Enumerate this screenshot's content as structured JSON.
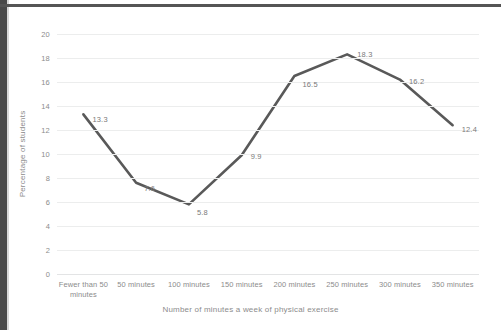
{
  "figure": {
    "frame_color": "#4a4a4a",
    "background": "#ffffff"
  },
  "chart_data": {
    "type": "line",
    "title": "",
    "categories": [
      "Fewer than 50 minutes",
      "50 minutes",
      "100 minutes",
      "150 minutes",
      "200 minutes",
      "250 minutes",
      "300 minutes",
      "350 minutes"
    ],
    "values": [
      13.3,
      7.6,
      5.8,
      9.9,
      16.5,
      18.3,
      16.2,
      12.4
    ],
    "data_labels": [
      "13.3",
      "7.6",
      "5.8",
      "9.9",
      "16.5",
      "18.3",
      "16.2",
      "12.4"
    ],
    "xlabel": "Number of minutes a week of physical exercise",
    "ylabel": "Percentage of students",
    "ylim": [
      0,
      20
    ],
    "ytick_step": 2,
    "yticks": [
      "20",
      "18",
      "16",
      "14",
      "12",
      "10",
      "8",
      "6",
      "4",
      "2",
      "0"
    ],
    "grid": true,
    "grid_axis": "y",
    "legend": false,
    "series_color": "#595959",
    "series_width": 2.6,
    "markers": false,
    "label_color": "#7a7a7a",
    "tick_color": "#8c8c8c",
    "gridline_color": "#eceded"
  }
}
